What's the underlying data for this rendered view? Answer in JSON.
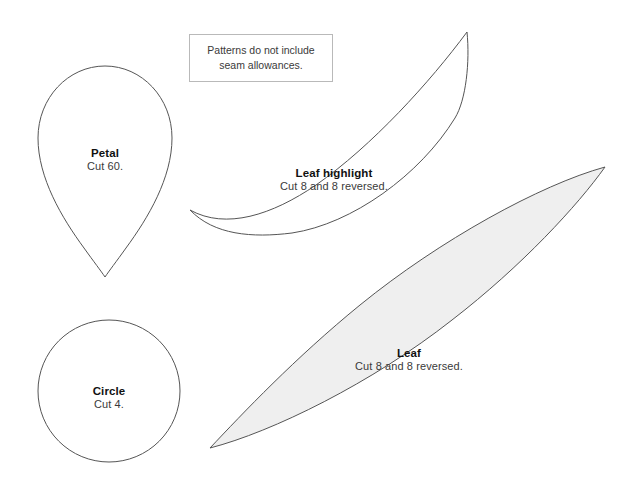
{
  "page": {
    "kind": "sewing-pattern-template-sheet",
    "background_color": "#ffffff",
    "width": 636,
    "height": 502
  },
  "note": {
    "line1": "Patterns do not include",
    "line2": "seam allowances.",
    "border_color": "#b9b9b9"
  },
  "pieces": [
    {
      "id": "petal",
      "title": "Petal",
      "subtitle": "Cut 60.",
      "shape": "teardrop",
      "fill": "#ffffff",
      "stroke": "#555555"
    },
    {
      "id": "circle",
      "title": "Circle",
      "subtitle": "Cut 4.",
      "shape": "circle",
      "fill": "#ffffff",
      "stroke": "#555555"
    },
    {
      "id": "leaf-highlight",
      "title": "Leaf highlight",
      "subtitle": "Cut 8 and 8 reversed.",
      "shape": "crescent",
      "fill": "#ffffff",
      "stroke": "#555555"
    },
    {
      "id": "leaf",
      "title": "Leaf",
      "subtitle": "Cut 8 and 8 reversed.",
      "shape": "pointed-oval",
      "fill": "#efefef",
      "stroke": "#555555"
    }
  ]
}
